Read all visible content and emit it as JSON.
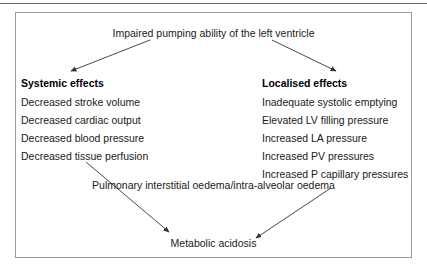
{
  "figure": {
    "title": "Impaired pumping ability of the left ventricle",
    "bottom_outcome": "Metabolic acidosis",
    "wide_outcome": "Pulmonary interstitial oedema/intra-alveolar oedema",
    "border_color": "#9a9a9a",
    "rule_color": "#6e6e6e",
    "text_color": "#1a1a1a",
    "arrow_color": "#333333"
  },
  "columns": {
    "left": {
      "heading": "Systemic effects",
      "items": [
        "Decreased stroke volume",
        "Decreased cardiac output",
        "Decreased blood pressure",
        "Decreased tissue perfusion"
      ]
    },
    "right": {
      "heading": "Localised effects",
      "items": [
        "Inadequate systolic emptying",
        "Elevated LV filling pressure",
        "Increased LA pressure",
        "Increased PV pressures",
        "Increased P capillary pressures"
      ]
    }
  },
  "arrows": [
    {
      "name": "title-to-systemic",
      "x1": 150,
      "y1": 40,
      "x2": 71,
      "y2": 71
    },
    {
      "name": "title-to-localised",
      "x1": 272,
      "y1": 40,
      "x2": 336,
      "y2": 71
    },
    {
      "name": "systemic-to-acidosis",
      "x1": 86,
      "y1": 162,
      "x2": 169,
      "y2": 232
    },
    {
      "name": "pulmonary-to-acidosis",
      "x1": 331,
      "y1": 188,
      "x2": 256,
      "y2": 238
    }
  ]
}
